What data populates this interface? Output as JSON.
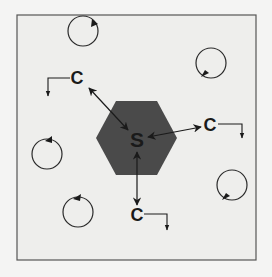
{
  "diagram": {
    "colors": {
      "background": "#f4f4f3",
      "frame_fill": "#eeeeec",
      "frame_stroke": "#555555",
      "hexagon_fill": "#4a4a4a",
      "ink": "#1a1a1a"
    },
    "center": {
      "label": "S",
      "shape": "hexagon"
    },
    "nodes": [
      {
        "id": "c-top-left",
        "label": "C"
      },
      {
        "id": "c-right",
        "label": "C"
      },
      {
        "id": "c-bottom",
        "label": "C"
      }
    ],
    "edges": [
      {
        "from": "S",
        "to": "c-top-left",
        "style": "bidirectional-arrow"
      },
      {
        "from": "S",
        "to": "c-right",
        "style": "bidirectional-arrow"
      },
      {
        "from": "S",
        "to": "c-bottom",
        "style": "bidirectional-arrow"
      }
    ],
    "rotating_circles": [
      {
        "id": "circle-1",
        "arrow": "clockwise"
      },
      {
        "id": "circle-2",
        "arrow": "clockwise"
      },
      {
        "id": "circle-3",
        "arrow": "clockwise"
      },
      {
        "id": "circle-4",
        "arrow": "counterclockwise"
      },
      {
        "id": "circle-5",
        "arrow": "clockwise"
      }
    ]
  }
}
